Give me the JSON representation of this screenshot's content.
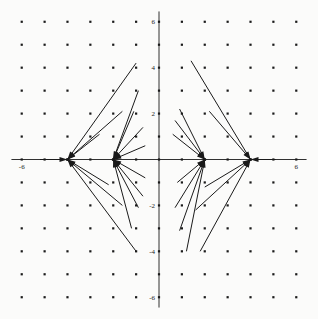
{
  "figure": {
    "title": "",
    "background_color": "#fbfbfa",
    "foreground_color": "#1a1a1a",
    "width": 318,
    "height": 319
  },
  "axes": {
    "x_axis_name": "x-axis",
    "y_axis_name": "y-axis",
    "xlabel": "",
    "ylabel": "",
    "xlim": [
      -6.6,
      6.6
    ],
    "ylim": [
      -6.6,
      6.6
    ],
    "x_tick_labels": [
      "-6",
      "6"
    ],
    "y_tick_labels": [
      "6",
      "4",
      "2",
      "-2",
      "-4",
      "-6"
    ],
    "x_ticks_values": [
      -6,
      6
    ],
    "y_ticks_values": [
      6,
      4,
      2,
      -2,
      -4,
      -6
    ]
  },
  "chart_data": {
    "type": "scatter",
    "title": "",
    "xlabel": "",
    "ylabel": "",
    "xlim": [
      -6.6,
      6.6
    ],
    "ylim": [
      -6.6,
      6.6
    ],
    "grid": false,
    "grid_dots": {
      "name": "lattice-dots",
      "x_values": [
        -6,
        -5,
        -4,
        -3,
        -2,
        -1,
        0,
        1,
        2,
        3,
        4,
        5,
        6
      ],
      "y_values": [
        -6,
        -5,
        -4,
        -3,
        -2,
        -1,
        0,
        1,
        2,
        3,
        4,
        5,
        6
      ],
      "marker": "square",
      "marker_size_px": 2.2,
      "color": "#1a1a1a",
      "count": 169
    },
    "equilibria": [
      {
        "label": "sink-left-outer",
        "x": -4,
        "y": 0
      },
      {
        "label": "sink-left-inner",
        "x": -2,
        "y": 0
      },
      {
        "label": "sink-right-inner",
        "x": 2,
        "y": 0
      },
      {
        "label": "sink-right-outer",
        "x": 4,
        "y": 0
      }
    ],
    "arrows": [
      {
        "target": [
          -4,
          0
        ],
        "tail": [
          -1.0,
          4.2
        ]
      },
      {
        "target": [
          -4,
          0
        ],
        "tail": [
          -1.6,
          2.1
        ]
      },
      {
        "target": [
          -4,
          0
        ],
        "tail": [
          -2.6,
          1.1
        ]
      },
      {
        "target": [
          -4,
          0
        ],
        "tail": [
          -5.2,
          0.0
        ]
      },
      {
        "target": [
          -4,
          0
        ],
        "tail": [
          -2.2,
          -1.1
        ]
      },
      {
        "target": [
          -4,
          0
        ],
        "tail": [
          -1.6,
          -2.0
        ]
      },
      {
        "target": [
          -4,
          0
        ],
        "tail": [
          -1.0,
          -4.0
        ]
      },
      {
        "target": [
          -2,
          0
        ],
        "tail": [
          -0.9,
          3.0
        ]
      },
      {
        "target": [
          -2,
          0
        ],
        "tail": [
          -1.1,
          2.1
        ]
      },
      {
        "target": [
          -2,
          0
        ],
        "tail": [
          -0.7,
          1.4
        ]
      },
      {
        "target": [
          -2,
          0
        ],
        "tail": [
          -0.6,
          0.6
        ]
      },
      {
        "target": [
          -2,
          0
        ],
        "tail": [
          -0.6,
          -0.8
        ]
      },
      {
        "target": [
          -2,
          0
        ],
        "tail": [
          -0.7,
          -1.6
        ]
      },
      {
        "target": [
          -2,
          0
        ],
        "tail": [
          -0.9,
          -2.1
        ]
      },
      {
        "target": [
          -2,
          0
        ],
        "tail": [
          -1.2,
          -3.0
        ]
      },
      {
        "target": [
          2,
          0
        ],
        "tail": [
          0.9,
          2.2
        ]
      },
      {
        "target": [
          2,
          0
        ],
        "tail": [
          0.7,
          1.7
        ]
      },
      {
        "target": [
          2,
          0
        ],
        "tail": [
          0.6,
          1.1
        ]
      },
      {
        "target": [
          2,
          0
        ],
        "tail": [
          0.8,
          -1.0
        ]
      },
      {
        "target": [
          2,
          0
        ],
        "tail": [
          0.7,
          -2.1
        ]
      },
      {
        "target": [
          2,
          0
        ],
        "tail": [
          0.9,
          -3.1
        ]
      },
      {
        "target": [
          2,
          0
        ],
        "tail": [
          1.2,
          -4.0
        ]
      },
      {
        "target": [
          4,
          0
        ],
        "tail": [
          1.4,
          4.3
        ]
      },
      {
        "target": [
          4,
          0
        ],
        "tail": [
          2.2,
          2.1
        ]
      },
      {
        "target": [
          4,
          0
        ],
        "tail": [
          5.1,
          0.0
        ]
      },
      {
        "target": [
          4,
          0
        ],
        "tail": [
          2.0,
          -1.2
        ]
      },
      {
        "target": [
          4,
          0
        ],
        "tail": [
          1.6,
          -2.2
        ]
      },
      {
        "target": [
          4,
          0
        ],
        "tail": [
          1.8,
          -4.0
        ]
      }
    ],
    "line_color": "#1a1a1a",
    "line_width_px": 1.0,
    "arrowhead": true
  }
}
